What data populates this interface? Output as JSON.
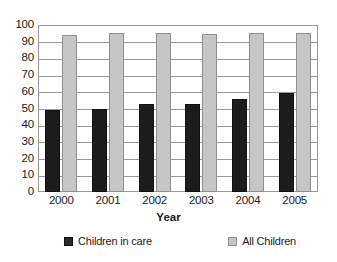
{
  "chart_data": {
    "type": "bar",
    "title": "",
    "xlabel": "Year",
    "ylabel": "",
    "categories": [
      "2000",
      "2001",
      "2002",
      "2003",
      "2004",
      "2005"
    ],
    "series": [
      {
        "name": "Children in care",
        "color": "#1c1c1c",
        "values": [
          49,
          50,
          53,
          52.5,
          55.5,
          59.5
        ]
      },
      {
        "name": "All Children",
        "color": "#c6c6c6",
        "values": [
          94,
          95,
          95,
          94.5,
          95.5,
          95.5
        ]
      }
    ],
    "ylim": [
      0,
      100
    ],
    "yticks": [
      "0",
      "10",
      "20",
      "30",
      "40",
      "50",
      "60",
      "70",
      "80",
      "90",
      "100"
    ],
    "ytick_values": [
      0,
      10,
      20,
      30,
      40,
      50,
      60,
      70,
      80,
      90,
      100
    ],
    "grid": true,
    "legend_position": "bottom"
  },
  "legend": {
    "entries": [
      {
        "label": "Children in care",
        "swatch": "dark-square-icon"
      },
      {
        "label": "All Children",
        "swatch": "light-square-icon"
      }
    ]
  }
}
